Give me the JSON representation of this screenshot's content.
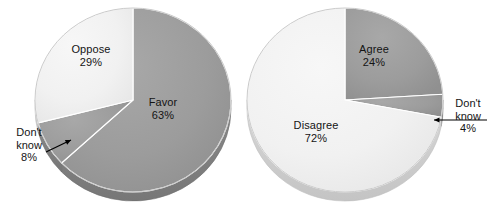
{
  "figure": {
    "background_color": "#ffffff",
    "chart_count": 2
  },
  "colors": {
    "dark_slice": "#9a9a9a",
    "dark_slice_side": "#7e7e7e",
    "light_slice": "#f1f1f1",
    "light_slice_side": "#c9c9c9",
    "separator": "#ffffff",
    "outline": "#b4b4b4",
    "text": "#141414",
    "arrow": "#000000"
  },
  "chart_data": [
    {
      "type": "pie",
      "title": "",
      "id": "left-pie",
      "legend_position": "none",
      "labels": [
        "Favor",
        "Don't know",
        "Oppose"
      ],
      "values": [
        63,
        8,
        29
      ],
      "value_labels": [
        "63%",
        "8%",
        "29%"
      ],
      "colors": [
        "#9a9a9a",
        "#9a9a9a",
        "#f1f1f1"
      ],
      "start_angle_deg": 0,
      "direction": "clockwise",
      "slices": [
        {
          "name": "Favor",
          "value": 63,
          "value_label": "63%",
          "color": "#9a9a9a",
          "label_placement": "inside",
          "label_x": 163,
          "label_y": 108
        },
        {
          "name": "Don't know",
          "value": 8,
          "value_label": "8%",
          "color": "#9a9a9a",
          "label_placement": "callout",
          "label_x": 29,
          "label_y": 145,
          "arrow_from_x": 46,
          "arrow_from_y": 152,
          "arrow_to_x": 71,
          "arrow_to_y": 140
        },
        {
          "name": "Oppose",
          "value": 29,
          "value_label": "29%",
          "color": "#f1f1f1",
          "label_placement": "inside",
          "label_x": 91,
          "label_y": 55
        }
      ]
    },
    {
      "type": "pie",
      "title": "",
      "id": "right-pie",
      "legend_position": "none",
      "labels": [
        "Agree",
        "Don't know",
        "Disagree"
      ],
      "values": [
        24,
        4,
        72
      ],
      "value_labels": [
        "24%",
        "4%",
        "72%"
      ],
      "colors": [
        "#9a9a9a",
        "#9a9a9a",
        "#f1f1f1"
      ],
      "start_angle_deg": 0,
      "direction": "clockwise",
      "slices": [
        {
          "name": "Agree",
          "value": 24,
          "value_label": "24%",
          "color": "#9a9a9a",
          "label_placement": "inside",
          "label_x": 374,
          "label_y": 55
        },
        {
          "name": "Don't know",
          "value": 4,
          "value_label": "4%",
          "color": "#9a9a9a",
          "label_placement": "callout",
          "label_x": 468,
          "label_y": 116,
          "arrow_from_x": 487,
          "arrow_from_y": 120,
          "arrow_to_x": 434,
          "arrow_to_y": 120
        },
        {
          "name": "Disagree",
          "value": 72,
          "value_label": "72%",
          "color": "#f1f1f1",
          "label_placement": "inside",
          "label_x": 316,
          "label_y": 131
        }
      ]
    }
  ]
}
